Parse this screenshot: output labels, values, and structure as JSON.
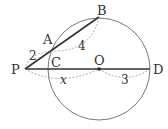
{
  "diagram": {
    "type": "geometry-secant-circle",
    "points": {
      "P": {
        "label": "P",
        "x": 25,
        "y": 69
      },
      "A": {
        "label": "A",
        "x": 51,
        "y": 51
      },
      "B": {
        "label": "B",
        "x": 99,
        "y": 17
      },
      "C": {
        "label": "C",
        "x": 49,
        "y": 69
      },
      "O": {
        "label": "O",
        "x": 99,
        "y": 69
      },
      "D": {
        "label": "D",
        "x": 150,
        "y": 69
      }
    },
    "circle": {
      "center": "O",
      "cx": 99,
      "cy": 69,
      "r": 51
    },
    "segments": [
      {
        "from": "P",
        "to": "B",
        "style": "bold"
      },
      {
        "from": "P",
        "to": "D",
        "style": "bold"
      }
    ],
    "measures": {
      "PA": "2",
      "AB": "4",
      "PO": "x",
      "OD": "3"
    },
    "colors": {
      "line": "#333333",
      "circle": "#555555",
      "dashed": "#888888"
    }
  }
}
